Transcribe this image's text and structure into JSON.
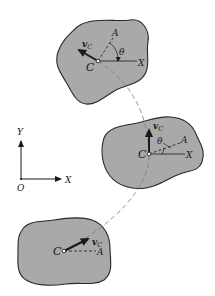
{
  "figure": {
    "type": "rigid-body-plane-motion",
    "colors": {
      "body_fill": "#a9a9a9",
      "outline": "#2a2a2a",
      "path": "#7a7a7a",
      "ink": "#1a1a1a"
    },
    "axes": {
      "origin_label": "O",
      "x_label": "X",
      "y_label": "Y"
    },
    "bodies": [
      {
        "position": "top",
        "center_label": "C",
        "point_label": "A",
        "ref_axis_label": "X",
        "angle_label": "θ",
        "velocity_label": "v",
        "velocity_sub": "C"
      },
      {
        "position": "middle",
        "center_label": "C",
        "point_label": "A",
        "ref_axis_label": "X",
        "angle_label": "θ",
        "velocity_label": "v",
        "velocity_sub": "C"
      },
      {
        "position": "bottom",
        "center_label": "C",
        "point_label": "A",
        "velocity_label": "v",
        "velocity_sub": "C"
      }
    ],
    "path_label": "trajectory of C (dashed)"
  }
}
